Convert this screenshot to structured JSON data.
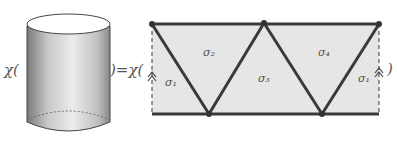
{
  "equation": {
    "lhs_func": "χ(",
    "equals": ")=χ(",
    "rhs_close": ")"
  },
  "cylinder": {
    "label": "cylinder surface (stippled)"
  },
  "triangulation": {
    "simplices": [
      {
        "id": "s1_left",
        "label": "σ₁"
      },
      {
        "id": "s2",
        "label": "σ₂"
      },
      {
        "id": "s3",
        "label": "σ₃"
      },
      {
        "id": "s4",
        "label": "σ₄"
      },
      {
        "id": "s1_right",
        "label": "σ₁"
      }
    ],
    "identified_edges": "left and right dashed edges identified (double arrow)"
  },
  "colors": {
    "stroke": "#3a3a3a",
    "fill": "#e6e6e6",
    "text": "#555555"
  }
}
